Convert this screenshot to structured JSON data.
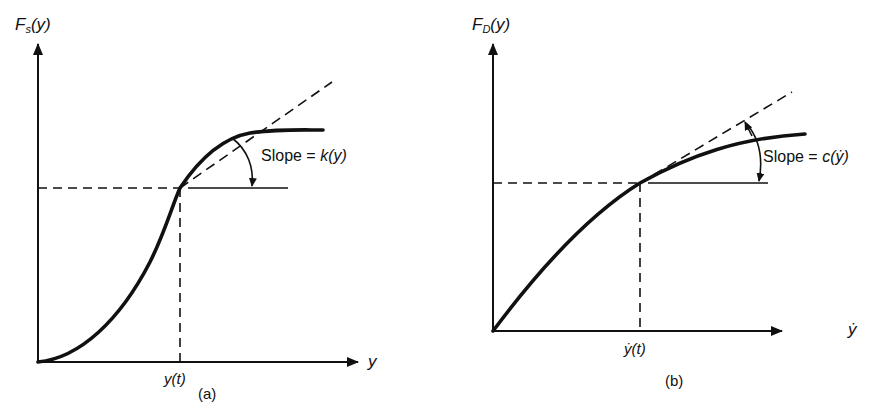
{
  "panels": [
    {
      "id": "a",
      "caption": "(a)",
      "y_axis_label_main": "F",
      "y_axis_label_sub": "s",
      "y_axis_label_arg": "(y)",
      "x_axis_label": "y",
      "x_tick_label": "y(t)",
      "slope_label_prefix": "Slope = ",
      "slope_label_func": "k(y)",
      "curve_shape": "sigmoid (S-shaped), stiffening then softening"
    },
    {
      "id": "b",
      "caption": "(b)",
      "y_axis_label_main": "F",
      "y_axis_label_sub": "D",
      "y_axis_label_arg": "(y)",
      "x_axis_label": "ẏ",
      "x_tick_label": "ẏ(t)",
      "slope_label_prefix": "Slope = ",
      "slope_label_func": "c(ẏ)",
      "curve_shape": "concave (monotonically softening)"
    }
  ],
  "colors": {
    "ink": "#111111",
    "background": "#ffffff"
  }
}
